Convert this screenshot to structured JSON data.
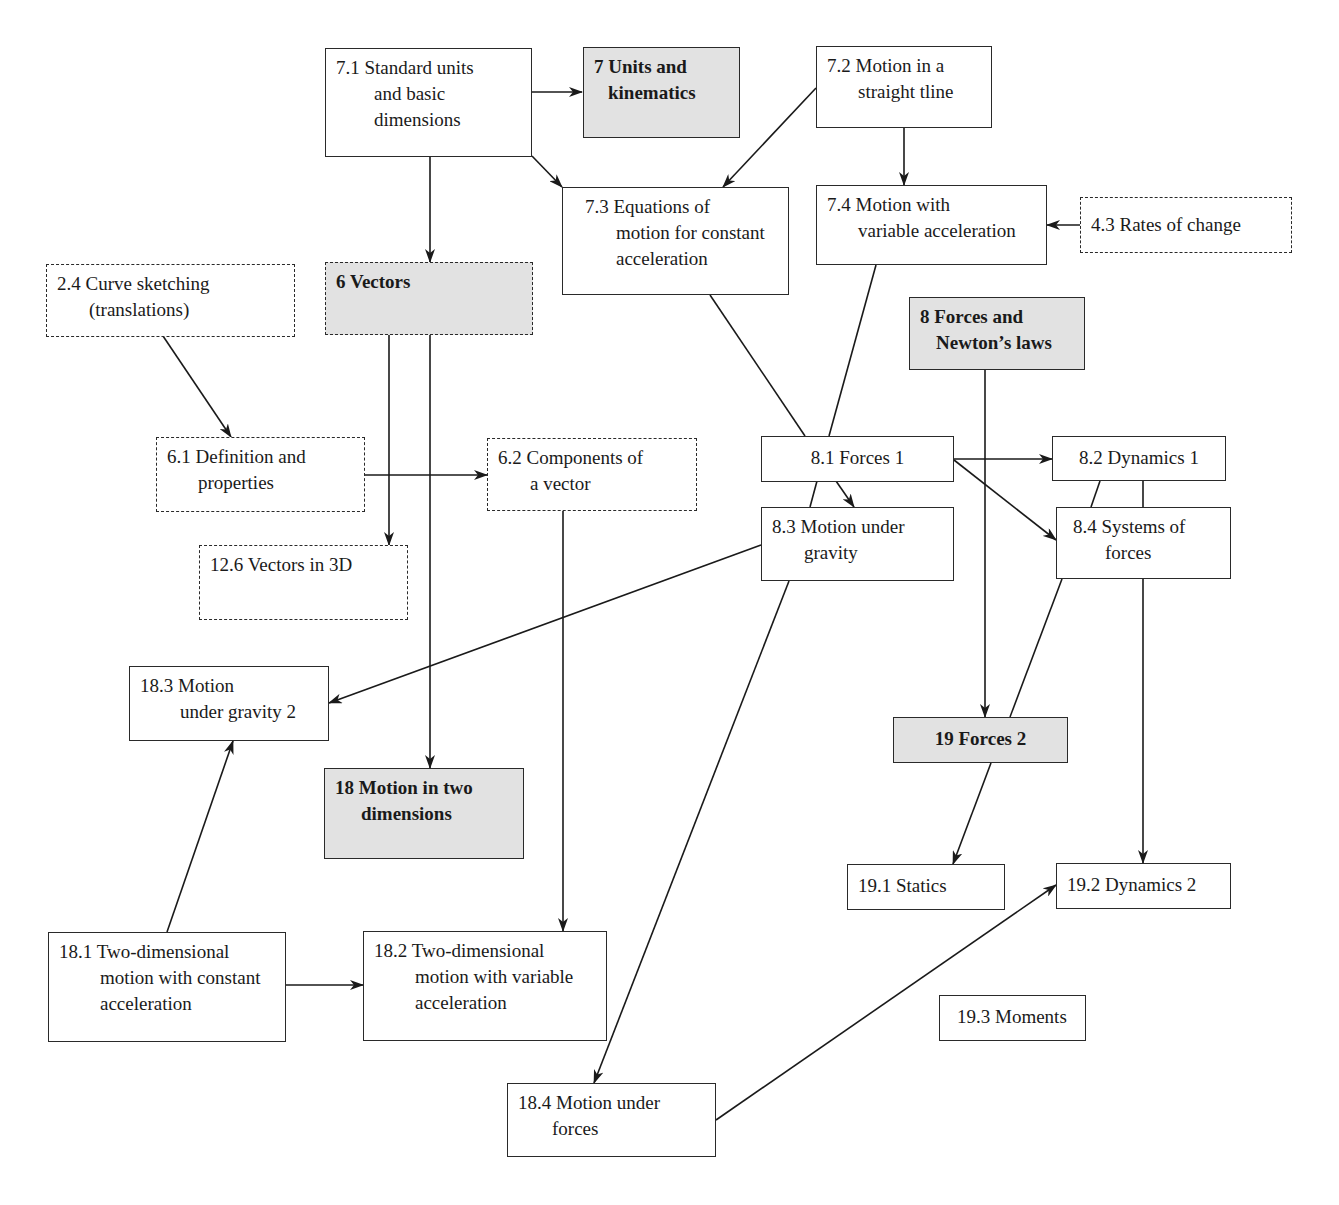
{
  "diagram": {
    "type": "topic-dependency-map",
    "legend_styles": {
      "chapter": {
        "fill": "#e2e2e2",
        "border": "solid",
        "bold": true
      },
      "section": {
        "fill": "#ffffff",
        "border": "solid"
      },
      "prerequisite_other_book": {
        "fill": "#ffffff",
        "border": "dashed"
      }
    },
    "nodes": {
      "n7_1": {
        "l1": "7.1 Standard units",
        "l2": "and basic",
        "l3": "dimensions"
      },
      "n7": {
        "l1": "7 Units and",
        "l2": "kinematics"
      },
      "n7_2": {
        "l1": "7.2 Motion in a",
        "l2": "straight tline"
      },
      "n7_3": {
        "l1": "7.3 Equations of",
        "l2": "motion for constant",
        "l3": "acceleration"
      },
      "n7_4": {
        "l1": "7.4 Motion with",
        "l2": "variable acceleration"
      },
      "n4_3": {
        "l1": "4.3 Rates of change"
      },
      "n2_4": {
        "l1": "2.4 Curve sketching",
        "l2": "(translations)"
      },
      "n6": {
        "l1": "6 Vectors"
      },
      "n8": {
        "l1": "8 Forces and",
        "l2": "Newton’s laws"
      },
      "n6_1": {
        "l1": "6.1 Definition and",
        "l2": "properties"
      },
      "n6_2": {
        "l1": "6.2 Components of",
        "l2": "a vector"
      },
      "n8_1": {
        "l1": "8.1 Forces 1"
      },
      "n8_2": {
        "l1": "8.2 Dynamics 1"
      },
      "n8_3": {
        "l1": "8.3 Motion under",
        "l2": "gravity"
      },
      "n8_4": {
        "l1": "8.4 Systems of",
        "l2": "forces"
      },
      "n12_6": {
        "l1": "12.6 Vectors in 3D"
      },
      "n18_3": {
        "l1": "18.3 Motion",
        "l2": "under gravity 2"
      },
      "n18": {
        "l1": "18 Motion in two",
        "l2": "dimensions"
      },
      "n19": {
        "l1": "19 Forces 2"
      },
      "n19_1": {
        "l1": "19.1 Statics"
      },
      "n19_2": {
        "l1": "19.2 Dynamics 2"
      },
      "n18_1": {
        "l1": "18.1 Two-dimensional",
        "l2": "motion with constant",
        "l3": "acceleration"
      },
      "n18_2": {
        "l1": "18.2 Two-dimensional",
        "l2": "motion with variable",
        "l3": "acceleration"
      },
      "n19_3": {
        "l1": "19.3 Moments"
      },
      "n18_4": {
        "l1": "18.4 Motion under",
        "l2": "forces"
      }
    },
    "edges": [
      {
        "from": "7.1",
        "to": "7 Units and kinematics",
        "arrow": true
      },
      {
        "from": "7.1",
        "to": "7.3",
        "arrow": true
      },
      {
        "from": "7.1",
        "to": "6 Vectors",
        "arrow": true
      },
      {
        "from": "7.2",
        "to": "7.3",
        "arrow": true
      },
      {
        "from": "7.2",
        "to": "7.4",
        "arrow": true
      },
      {
        "from": "4.3",
        "to": "7.4",
        "arrow": true
      },
      {
        "from": "2.4",
        "to": "6.1",
        "arrow": true
      },
      {
        "from": "6 Vectors",
        "to": "12.6",
        "arrow": true
      },
      {
        "from": "6 Vectors",
        "to": "18 Motion in two dimensions",
        "arrow": true
      },
      {
        "from": "6.1",
        "to": "6.2",
        "arrow": true
      },
      {
        "from": "6.2",
        "to": "18.2",
        "arrow": true
      },
      {
        "from": "7.3",
        "to": "8.1",
        "arrow": false
      },
      {
        "from": "7.4",
        "to": "18.4",
        "arrow": true
      },
      {
        "from": "8.1",
        "to": "8.2",
        "arrow": true
      },
      {
        "from": "8.1",
        "to": "8.3",
        "arrow": true
      },
      {
        "from": "8.1",
        "to": "8.4",
        "arrow": true
      },
      {
        "from": "8 Forces and Newton's laws",
        "to": "19 Forces 2",
        "arrow": true
      },
      {
        "from": "8.2",
        "to": "8.4",
        "arrow": false
      },
      {
        "from": "8.4",
        "to": "19 Forces 2",
        "arrow": false
      },
      {
        "from": "8.4",
        "to": "19.2",
        "arrow": true
      },
      {
        "from": "8.3",
        "to": "18.3",
        "arrow": true
      },
      {
        "from": "19 Forces 2",
        "to": "19.1",
        "arrow": true
      },
      {
        "from": "18.1",
        "to": "18.3",
        "arrow": true
      },
      {
        "from": "18.1",
        "to": "18.2",
        "arrow": true
      },
      {
        "from": "18.4",
        "to": "19.2",
        "arrow": true
      }
    ]
  }
}
